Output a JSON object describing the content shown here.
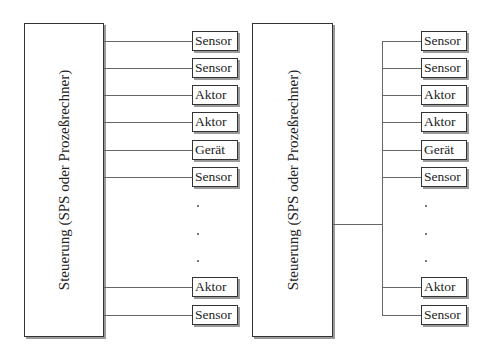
{
  "diagrams": [
    {
      "id": "point-to-point",
      "controller": {
        "label": "Steuerung (SPS oder Prozeßrechner)"
      },
      "devices": [
        {
          "label": "Sensor"
        },
        {
          "label": "Sensor"
        },
        {
          "label": "Aktor"
        },
        {
          "label": "Aktor"
        },
        {
          "label": "Gerät"
        },
        {
          "label": "Sensor"
        },
        {
          "label": "·"
        },
        {
          "label": "·"
        },
        {
          "label": "·"
        },
        {
          "label": "Aktor"
        },
        {
          "label": "Sensor"
        }
      ]
    },
    {
      "id": "bus",
      "controller": {
        "label": "Steuerung (SPS oder Prozeßrechner)"
      },
      "devices": [
        {
          "label": "Sensor"
        },
        {
          "label": "Sensor"
        },
        {
          "label": "Aktor"
        },
        {
          "label": "Aktor"
        },
        {
          "label": "Gerät"
        },
        {
          "label": "Sensor"
        },
        {
          "label": "·"
        },
        {
          "label": "·"
        },
        {
          "label": "·"
        },
        {
          "label": "Aktor"
        },
        {
          "label": "Sensor"
        }
      ]
    }
  ]
}
